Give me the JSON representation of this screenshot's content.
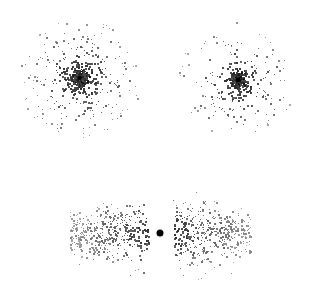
{
  "figure": {
    "width": 317,
    "height": 286,
    "background_color": "#ffffff",
    "point_color": "#1a1a1a",
    "has_axes": false,
    "has_labels": false,
    "has_legend": false,
    "panel_count": 3
  },
  "chart_data": {
    "type": "scatter",
    "title": "",
    "subtitle": "",
    "xlabel": "",
    "ylabel": "",
    "grid": false,
    "legend_position": "none",
    "axes_visible": false,
    "tick_labels": [],
    "annotations": [],
    "xlim": [
      0,
      317
    ],
    "ylim": [
      0,
      286
    ],
    "background": "#ffffff",
    "marker_color": "#1a1a1a",
    "marker_shape": "square",
    "marker_size_min": 1,
    "marker_size_max": 2,
    "panels": [
      {
        "name": "top-left-cluster",
        "profile": "spherical",
        "center_x": 80,
        "center_y": 78,
        "radius_x": 62,
        "radius_y": 60,
        "n_points": 620,
        "concentration": 2.1,
        "core_marker": {
          "present": true,
          "center_x": 80,
          "center_y": 78,
          "diameter": 4,
          "color": "#000000"
        }
      },
      {
        "name": "top-right-cluster",
        "profile": "spherical",
        "center_x": 238,
        "center_y": 80,
        "radius_x": 60,
        "radius_y": 58,
        "n_points": 600,
        "concentration": 3.4,
        "core_marker": {
          "present": true,
          "center_x": 238,
          "center_y": 80,
          "diameter": 5,
          "color": "#000000"
        }
      },
      {
        "name": "bottom-bipolar-cluster",
        "profile": "bipolar",
        "center_x": 160,
        "center_y": 233,
        "radius_x": 90,
        "radius_y": 48,
        "n_points": 900,
        "concentration": 1.6,
        "lobe_gap": 12,
        "core_marker": {
          "present": true,
          "center_x": 160,
          "center_y": 233,
          "diameter": 7,
          "color": "#000000"
        }
      }
    ]
  }
}
